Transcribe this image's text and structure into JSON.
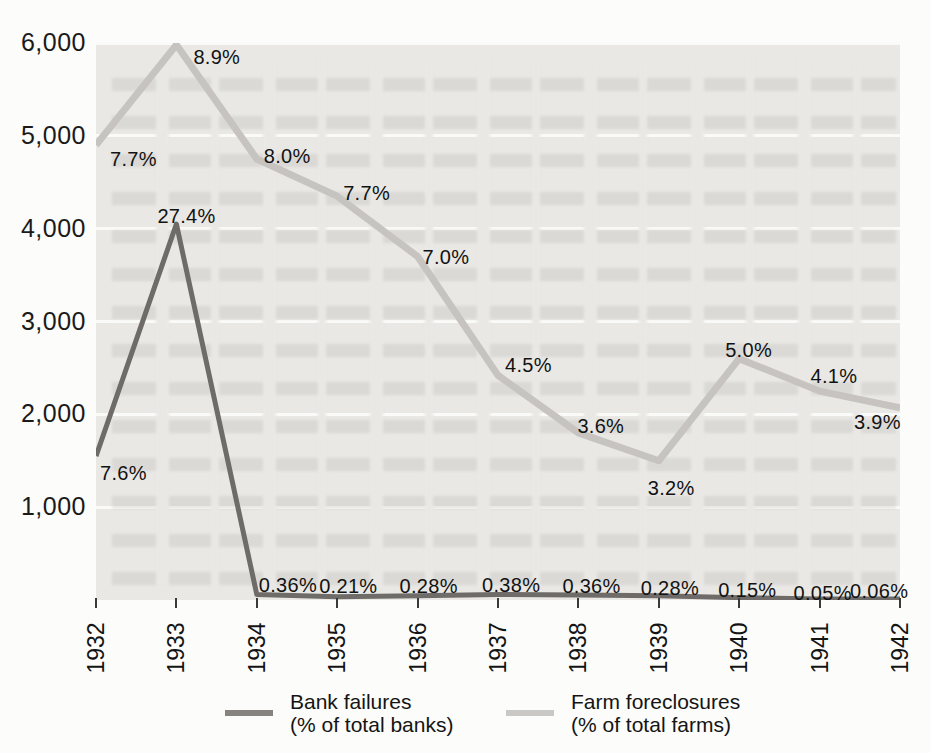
{
  "chart_data": {
    "type": "line",
    "title": "",
    "xlabel": "",
    "ylabel": "",
    "categories": [
      "1932",
      "1933",
      "1934",
      "1935",
      "1936",
      "1937",
      "1938",
      "1939",
      "1940",
      "1941",
      "1942"
    ],
    "ylim": [
      0,
      6000
    ],
    "grid": "horizontal white gridlines on light-gray plot background",
    "legend_position": "bottom",
    "y_ticks": [
      {
        "value": 1000,
        "label": "1,000"
      },
      {
        "value": 2000,
        "label": "2,000"
      },
      {
        "value": 3000,
        "label": "3,000"
      },
      {
        "value": 4000,
        "label": "4,000"
      },
      {
        "value": 5000,
        "label": "5,000"
      },
      {
        "value": 6000,
        "label": "6,000"
      }
    ],
    "series": [
      {
        "key": "farm-foreclosures",
        "name": "Farm foreclosures (% of total farms)",
        "color": "#c6c3c0",
        "stroke_width": 7,
        "points": [
          {
            "year": "1932",
            "value": 4900,
            "pct_label": "7.7%",
            "label_dx": 14,
            "label_dy": 3
          },
          {
            "year": "1933",
            "value": 5980,
            "pct_label": "8.9%",
            "label_dx": 17,
            "label_dy": 1
          },
          {
            "year": "1934",
            "value": 4750,
            "pct_label": "8.0%",
            "label_dx": 7,
            "label_dy": -14
          },
          {
            "year": "1935",
            "value": 4350,
            "pct_label": "7.7%",
            "label_dx": 6,
            "label_dy": -14
          },
          {
            "year": "1936",
            "value": 3700,
            "pct_label": "7.0%",
            "label_dx": 5,
            "label_dy": -11
          },
          {
            "year": "1937",
            "value": 2420,
            "pct_label": "4.5%",
            "label_dx": 7,
            "label_dy": -21
          },
          {
            "year": "1938",
            "value": 1800,
            "pct_label": "3.6%",
            "label_dx": -1,
            "label_dy": -18
          },
          {
            "year": "1939",
            "value": 1500,
            "pct_label": "3.2%",
            "label_dx": -11,
            "label_dy": 16
          },
          {
            "year": "1940",
            "value": 2600,
            "pct_label": "5.0%",
            "label_dx": -14,
            "label_dy": -20
          },
          {
            "year": "1941",
            "value": 2250,
            "pct_label": "4.1%",
            "label_dx": -9,
            "label_dy": -26
          },
          {
            "year": "1942",
            "value": 2070,
            "pct_label": "3.9%",
            "label_dx": -46,
            "label_dy": 3
          }
        ]
      },
      {
        "key": "bank-failures",
        "name": "Bank failures (% of total banks)",
        "color": "#6e6b69",
        "stroke_width": 5,
        "points": [
          {
            "year": "1932",
            "value": 1550,
            "pct_label": "7.6%",
            "label_dx": 4,
            "label_dy": 6
          },
          {
            "year": "1933",
            "value": 4050,
            "pct_label": "27.4%",
            "label_dx": -19,
            "label_dy": -19
          },
          {
            "year": "1934",
            "value": 60,
            "pct_label": "0.36%",
            "label_dx": 2,
            "label_dy": -20
          },
          {
            "year": "1935",
            "value": 35,
            "pct_label": "0.21%",
            "label_dx": -18,
            "label_dy": -22
          },
          {
            "year": "1936",
            "value": 45,
            "pct_label": "0.28%",
            "label_dx": -18,
            "label_dy": -21
          },
          {
            "year": "1937",
            "value": 60,
            "pct_label": "0.38%",
            "label_dx": -16,
            "label_dy": -20
          },
          {
            "year": "1938",
            "value": 55,
            "pct_label": "0.36%",
            "label_dx": -16,
            "label_dy": -20
          },
          {
            "year": "1939",
            "value": 45,
            "pct_label": "0.28%",
            "label_dx": -18,
            "label_dy": -19
          },
          {
            "year": "1940",
            "value": 25,
            "pct_label": "0.15%",
            "label_dx": -21,
            "label_dy": -19
          },
          {
            "year": "1941",
            "value": 12,
            "pct_label": "0.05%",
            "label_dx": -26,
            "label_dy": -17
          },
          {
            "year": "1942",
            "value": 10,
            "pct_label": "0.06%",
            "label_dx": -50,
            "label_dy": -19
          }
        ]
      }
    ]
  },
  "legend": {
    "items": [
      {
        "key": "bank-failures",
        "line1": "Bank failures",
        "line2": "(% of total banks)",
        "swatch_color": "#87847f"
      },
      {
        "key": "farm-foreclosures",
        "line1": "Farm foreclosures",
        "line2": "(% of total farms)",
        "swatch_color": "#cac8c5"
      }
    ]
  },
  "colors": {
    "page_background": "#fcfcfa",
    "plot_background": "#e9e8e5",
    "gridline": "#fafaf8",
    "text": "#181818"
  }
}
